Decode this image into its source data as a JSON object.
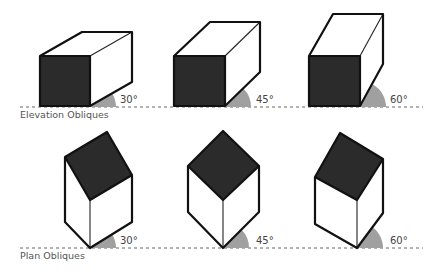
{
  "labels": {
    "elevation": "Elevation Obliques",
    "plan": "Plan Obliques"
  },
  "angles": {
    "e30": "30°",
    "e45": "45°",
    "e60": "60°",
    "p30": "30°",
    "p45": "45°",
    "p60": "60°"
  },
  "colors": {
    "dark_face": "#2b2b2b",
    "light_face": "#ffffff",
    "angle_wedge": "#a0a0a0",
    "baseline": "#666666"
  }
}
